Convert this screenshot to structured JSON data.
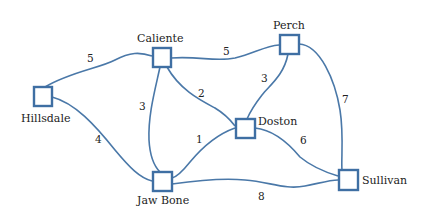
{
  "graph": {
    "nodes": [
      {
        "id": "hillsdale",
        "label": "Hillsdale",
        "x": 43,
        "y": 97
      },
      {
        "id": "caliente",
        "label": "Caliente",
        "x": 162,
        "y": 58
      },
      {
        "id": "perch",
        "label": "Perch",
        "x": 289,
        "y": 44
      },
      {
        "id": "doston",
        "label": "Doston",
        "x": 245,
        "y": 128
      },
      {
        "id": "jawbone",
        "label": "Jaw Bone",
        "x": 162,
        "y": 182
      },
      {
        "id": "sullivan",
        "label": "Sullivan",
        "x": 348,
        "y": 180
      }
    ],
    "edges": [
      {
        "from": "Hillsdale",
        "to": "Caliente",
        "weight": "5"
      },
      {
        "from": "Hillsdale",
        "to": "Jaw Bone",
        "weight": "4"
      },
      {
        "from": "Caliente",
        "to": "Perch",
        "weight": "5"
      },
      {
        "from": "Caliente",
        "to": "Jaw Bone",
        "weight": "3"
      },
      {
        "from": "Caliente",
        "to": "Doston",
        "weight": "2"
      },
      {
        "from": "Perch",
        "to": "Doston",
        "weight": "3"
      },
      {
        "from": "Perch",
        "to": "Sullivan",
        "weight": "7"
      },
      {
        "from": "Doston",
        "to": "Jaw Bone",
        "weight": "1"
      },
      {
        "from": "Doston",
        "to": "Sullivan",
        "weight": "6"
      },
      {
        "from": "Jaw Bone",
        "to": "Sullivan",
        "weight": "8"
      }
    ]
  },
  "colors": {
    "edge": "#4a78a8",
    "node_border": "#3f6fa3"
  }
}
